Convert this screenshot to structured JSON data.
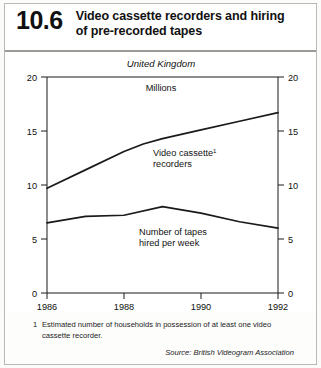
{
  "header": {
    "number": "10.6",
    "title_lines": [
      "Video cassette recorders and hiring",
      "of pre-recorded tapes"
    ]
  },
  "notes": {
    "footnote_marker": "1",
    "footnote_text": "Estimated number of households in possession of at least one video cassette recorder.",
    "source": "Source: British Videogram Association"
  },
  "chart_data": {
    "type": "line",
    "title": "Video cassette recorders and hiring of pre-recorded tapes",
    "region_label": "United Kingdom",
    "units_label": "Millions",
    "xlabel": "",
    "ylabel": "Millions",
    "xlim": [
      1986,
      1992
    ],
    "ylim": [
      0,
      20
    ],
    "ytick_values": [
      0,
      5,
      10,
      15,
      20
    ],
    "ytick_labels": [
      "0",
      "5",
      "10",
      "15",
      "20"
    ],
    "xtick_values": [
      1986,
      1988,
      1990,
      1992
    ],
    "xtick_labels": [
      "1986",
      "1988",
      "1990",
      "1992"
    ],
    "left_axis_labels": [
      "20",
      "15",
      "10",
      "5",
      "0"
    ],
    "right_axis_labels": [
      "20",
      "15",
      "10",
      "5",
      "0"
    ],
    "grid": false,
    "legend_position": "inline-annotations",
    "series": [
      {
        "name": "Video cassette recorders",
        "label_lines": [
          "Video cassette",
          "recorders"
        ],
        "footnote_marker": "1",
        "x": [
          1986,
          1987,
          1988,
          1988.5,
          1989,
          1990,
          1991,
          1992
        ],
        "values": [
          9.7,
          11.4,
          13.1,
          13.8,
          14.3,
          15.1,
          15.9,
          16.7
        ]
      },
      {
        "name": "Number of tapes hired per week",
        "label_lines": [
          "Number of tapes",
          "hired per week"
        ],
        "footnote_marker": "",
        "x": [
          1986,
          1987,
          1988,
          1989,
          1990,
          1991,
          1992
        ],
        "values": [
          6.5,
          7.1,
          7.2,
          8.0,
          7.4,
          6.6,
          6.0
        ]
      }
    ],
    "colors": {
      "line": "#1a1a1a",
      "axis": "#1a1a1a",
      "background": "#ffffff"
    }
  }
}
